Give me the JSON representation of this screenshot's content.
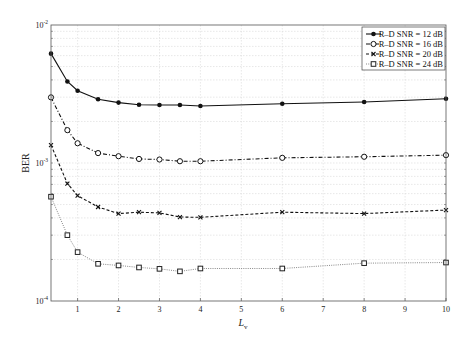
{
  "chart_data": {
    "type": "line",
    "title": "",
    "xlabel": "L",
    "xlabel_subscript": "v",
    "ylabel": "BER",
    "xlim": [
      0.35,
      10
    ],
    "ylim": [
      0.0001,
      0.01
    ],
    "yscale": "log",
    "grid": true,
    "legend_position": "upper right",
    "x": [
      0.35,
      0.75,
      1,
      1.5,
      2,
      2.5,
      3,
      3.5,
      4,
      6,
      8,
      10
    ],
    "xticks": [
      1,
      2,
      3,
      4,
      5,
      6,
      7,
      8,
      9,
      10
    ],
    "yticks": [
      {
        "value": 0.01,
        "base": "10",
        "exp": "-2"
      },
      {
        "value": 0.001,
        "base": "10",
        "exp": "-3"
      },
      {
        "value": 0.0001,
        "base": "10",
        "exp": "-4"
      }
    ],
    "series": [
      {
        "name": "R–D SNR = 12 dB",
        "marker": "filled-circle",
        "line": "solid",
        "color": "#111111",
        "values": [
          0.0062,
          0.0039,
          0.00334,
          0.0029,
          0.00274,
          0.00264,
          0.00263,
          0.00263,
          0.00259,
          0.00269,
          0.00277,
          0.00292
        ]
      },
      {
        "name": "R–D SNR = 16 dB",
        "marker": "open-circle",
        "line": "dashdot",
        "color": "#111111",
        "values": [
          0.00299,
          0.00173,
          0.00139,
          0.00118,
          0.00112,
          0.00107,
          0.00106,
          0.00103,
          0.00103,
          0.00109,
          0.00111,
          0.00114
        ]
      },
      {
        "name": "R–D SNR = 20 dB",
        "marker": "x",
        "line": "dashed",
        "color": "#111111",
        "values": [
          0.00135,
          0.00071,
          0.00058,
          0.00048,
          0.00043,
          0.00044,
          0.000435,
          0.000406,
          0.000404,
          0.00044,
          0.00043,
          0.000456
        ]
      },
      {
        "name": "R–D SNR = 24 dB",
        "marker": "open-square",
        "line": "dotted",
        "color": "#888888",
        "values": [
          0.00057,
          0.0003,
          0.000226,
          0.000186,
          0.000181,
          0.000175,
          0.000171,
          0.000164,
          0.000172,
          0.000172,
          0.000188,
          0.00019
        ]
      }
    ]
  }
}
